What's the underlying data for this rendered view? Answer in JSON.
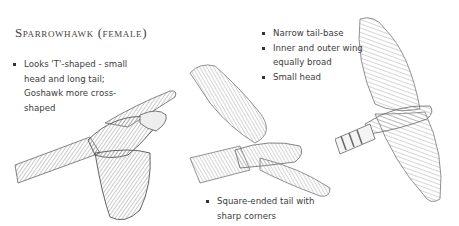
{
  "title": "Sparrowhawk (female)",
  "notes": {
    "left": [
      "Looks 'T'-shaped - small head and long tail; Goshawk more cross-shaped"
    ],
    "right": [
      "Narrow tail-base",
      "Inner and outer wing equally broad",
      "Small head"
    ],
    "bottom": [
      "Square-ended tail with sharp corners"
    ]
  },
  "illustrations": [
    {
      "name": "sparrowhawk-side-glide",
      "description": "Female sparrowhawk in side view gliding, long tail extended left"
    },
    {
      "name": "sparrowhawk-underside-tilted",
      "description": "Female sparrowhawk in flight, tilted, square-ended tail"
    },
    {
      "name": "sparrowhawk-underside-overhead",
      "description": "Female sparrowhawk from below, barred wings and banded tail"
    }
  ],
  "colors": {
    "text": "#3c3c3c",
    "pencil": "#7a7a7a",
    "background": "#ffffff"
  }
}
